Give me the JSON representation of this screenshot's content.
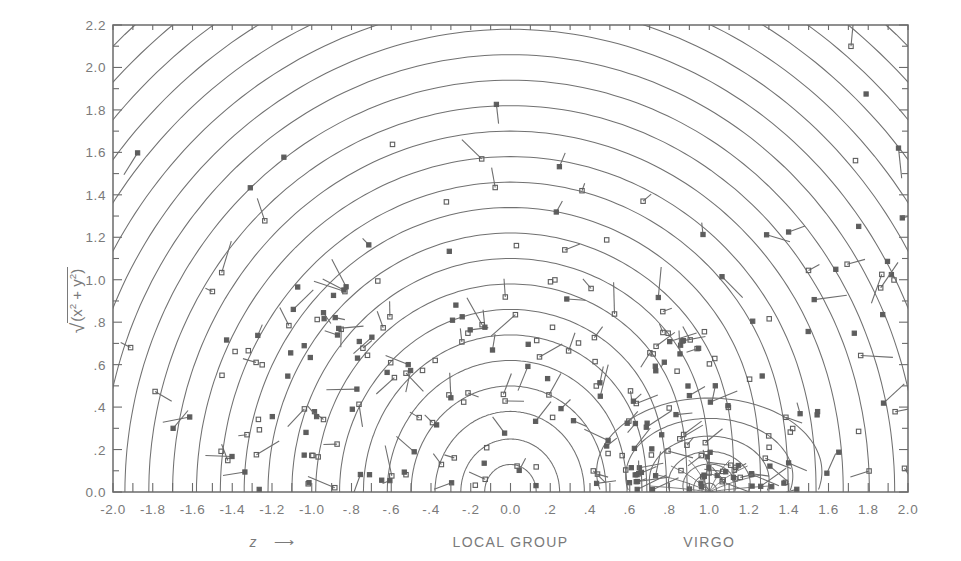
{
  "figure": {
    "kind": "contour-plot-with-markers",
    "background_color": "#ffffff",
    "ink_color": "#6f6f6f",
    "frame_color": "#6b6b6b"
  },
  "axes": {
    "x": {
      "label": "z",
      "label_arrow": "⟶",
      "min": -2.0,
      "max": 2.0,
      "major_step": 0.2,
      "minor_step": 0.1,
      "tick_labels": [
        "-2.0",
        "-1.8",
        "-1.6",
        "-1.4",
        "-1.2",
        "-1.0",
        "-.8",
        "-.6",
        "-.4",
        "-.2",
        "0.0",
        ".2",
        ".4",
        ".6",
        ".8",
        "1.0",
        "1.2",
        "1.4",
        "1.6",
        "1.8",
        "2.0"
      ],
      "tick_values": [
        -2.0,
        -1.8,
        -1.6,
        -1.4,
        -1.2,
        -1.0,
        -0.8,
        -0.6,
        -0.4,
        -0.2,
        0.0,
        0.2,
        0.4,
        0.6,
        0.8,
        1.0,
        1.2,
        1.4,
        1.6,
        1.8,
        2.0
      ]
    },
    "y": {
      "label": "√(x² + y²)",
      "min": 0.0,
      "max": 2.2,
      "major_step": 0.2,
      "minor_step": 0.1,
      "tick_labels": [
        "0.0",
        ".2",
        ".4",
        ".6",
        ".8",
        "1.0",
        "1.2",
        "1.4",
        "1.6",
        "1.8",
        "2.0",
        "2.2"
      ],
      "tick_values": [
        0.0,
        0.2,
        0.4,
        0.6,
        0.8,
        1.0,
        1.2,
        1.4,
        1.6,
        1.8,
        2.0,
        2.2
      ]
    }
  },
  "annotations": [
    {
      "text": "LOCAL GROUP",
      "x": 0.0,
      "name": "local-group-label"
    },
    {
      "text": "VIRGO",
      "x": 1.0,
      "name": "virgo-label"
    }
  ],
  "chart_data": {
    "type": "line",
    "title": "",
    "xlabel": "z",
    "ylabel": "√(x² + y²)",
    "xlim": [
      -2.0,
      2.0
    ],
    "ylim": [
      0.0,
      2.2
    ],
    "grid": false,
    "legend": "none",
    "attractors": [
      {
        "name": "LOCAL GROUP",
        "x": 0.0,
        "y": 0.0,
        "type": "primary"
      },
      {
        "name": "VIRGO",
        "x": 1.0,
        "y": 0.0,
        "type": "secondary"
      }
    ],
    "contours": {
      "family": "concentric-arcs-about-local-group",
      "levels": 27,
      "radii": [
        0.13,
        0.25,
        0.38,
        0.5,
        0.62,
        0.74,
        0.86,
        0.98,
        1.1,
        1.22,
        1.34,
        1.46,
        1.58,
        1.7,
        1.82,
        1.94,
        2.06,
        2.18,
        2.3,
        2.42,
        2.54,
        2.66,
        2.78,
        2.9,
        3.02,
        3.14,
        3.26
      ],
      "virgo_family": "small-closed-loops-about-virgo",
      "virgo_levels": 7,
      "virgo_radii": [
        0.035,
        0.07,
        0.11,
        0.16,
        0.22,
        0.29,
        0.37
      ]
    },
    "markers": {
      "symbol": "square",
      "open_and_filled": true,
      "count": 260,
      "with_velocity_vectors": true
    }
  }
}
